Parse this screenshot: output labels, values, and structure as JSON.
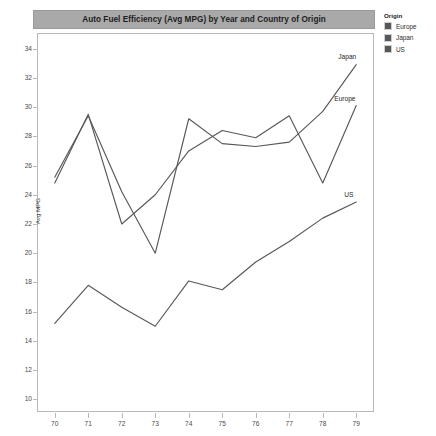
{
  "title": "Auto Fuel Efficiency (Avg MPG) by Year and Country of Origin",
  "legend": {
    "title": "Origin",
    "items": [
      {
        "label": "Europe",
        "color": "#58585a"
      },
      {
        "label": "Japan",
        "color": "#58585a"
      },
      {
        "label": "US",
        "color": "#58585a"
      }
    ]
  },
  "axes": {
    "ylabel": "Avg MPG",
    "xlabel": "",
    "yticks": [
      10,
      12,
      14,
      16,
      18,
      20,
      22,
      24,
      26,
      28,
      30,
      32,
      34
    ],
    "xticks": [
      "70",
      "71",
      "72",
      "73",
      "74",
      "75",
      "76",
      "77",
      "78",
      "79"
    ]
  },
  "series_labels": [
    {
      "name": "Japan",
      "text": "Japan"
    },
    {
      "name": "Europe",
      "text": "Europe"
    },
    {
      "name": "US",
      "text": "US"
    }
  ],
  "chart_data": {
    "type": "line",
    "title": "Auto Fuel Efficiency (Avg MPG) by Year and Country of Origin",
    "xlabel": "",
    "ylabel": "Avg MPG",
    "x": [
      70,
      71,
      72,
      73,
      74,
      75,
      76,
      77,
      78,
      79
    ],
    "xlim": [
      69.5,
      79.5
    ],
    "ylim": [
      9.2,
      35.0
    ],
    "grid": false,
    "legend_position": "right",
    "series": [
      {
        "name": "Europe",
        "color": "#58585a",
        "values": [
          24.8,
          29.5,
          22.0,
          24.0,
          27.0,
          28.4,
          27.9,
          29.4,
          24.8,
          30.1
        ]
      },
      {
        "name": "Japan",
        "color": "#58585a",
        "values": [
          25.2,
          29.4,
          24.2,
          20.0,
          29.2,
          27.5,
          27.3,
          27.6,
          29.7,
          32.9
        ]
      },
      {
        "name": "US",
        "color": "#58585a",
        "values": [
          15.2,
          17.8,
          16.3,
          15.0,
          18.1,
          17.5,
          19.4,
          20.8,
          22.4,
          23.5
        ]
      }
    ]
  }
}
